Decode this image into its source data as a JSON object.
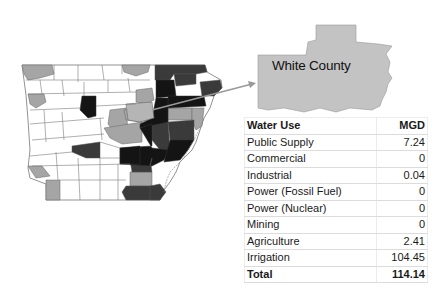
{
  "inset": {
    "county_name": "White County"
  },
  "table": {
    "headers": {
      "use": "Water Use",
      "value": "MGD"
    },
    "rows": [
      {
        "use": "Public Supply",
        "value": "7.24"
      },
      {
        "use": "Commercial",
        "value": "0"
      },
      {
        "use": "Industrial",
        "value": "0.04"
      },
      {
        "use": "Power (Fossil Fuel)",
        "value": "0"
      },
      {
        "use": "Power (Nuclear)",
        "value": "0"
      },
      {
        "use": "Mining",
        "value": "0"
      },
      {
        "use": "Agriculture",
        "value": "2.41"
      },
      {
        "use": "Irrigation",
        "value": "104.45"
      }
    ],
    "total": {
      "use": "Total",
      "value": "114.14"
    }
  },
  "map": {
    "state": "Arkansas",
    "legend_shades": {
      "light": "#ffffff",
      "medium": "#a6a6a6",
      "dark": "#3c3c3c",
      "darkest": "#141414"
    }
  }
}
